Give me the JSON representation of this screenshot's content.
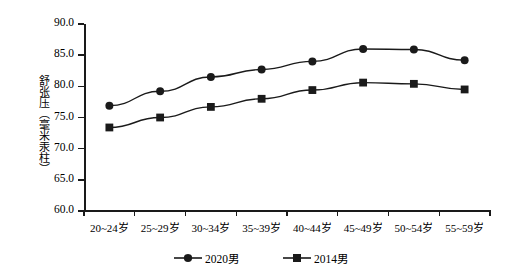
{
  "chart_data": {
    "type": "line",
    "title": "",
    "xlabel": "",
    "ylabel": "舒张压（毫米汞柱）",
    "categories": [
      "20~24岁",
      "25~29岁",
      "30~34岁",
      "35~39岁",
      "40~44岁",
      "45~49岁",
      "50~54岁",
      "55~59岁"
    ],
    "series": [
      {
        "name": "2020男",
        "marker": "circle",
        "color": "#1a1a1a",
        "values": [
          76.9,
          79.2,
          81.5,
          82.7,
          84.0,
          86.0,
          85.9,
          84.2
        ]
      },
      {
        "name": "2014男",
        "marker": "square",
        "color": "#1a1a1a",
        "values": [
          73.4,
          75.0,
          76.7,
          78.0,
          79.4,
          80.6,
          80.4,
          79.5
        ]
      }
    ],
    "ylim": [
      60.0,
      90.0
    ],
    "ytick_labels": [
      "90.0",
      "85.0",
      "80.0",
      "75.0",
      "70.0",
      "65.0",
      "60.0"
    ],
    "ytick_values": [
      90.0,
      85.0,
      80.0,
      75.0,
      70.0,
      65.0,
      60.0
    ],
    "grid": false,
    "legend_position": "bottom"
  }
}
